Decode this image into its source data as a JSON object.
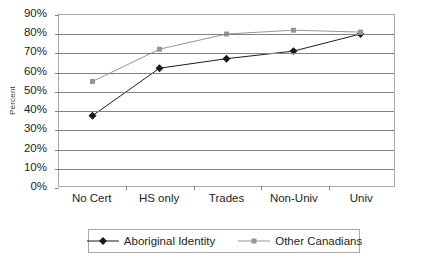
{
  "chart_data": {
    "type": "line",
    "title": "",
    "xlabel": "",
    "ylabel": "Percent",
    "categories": [
      "No Cert",
      "HS only",
      "Trades",
      "Non-Univ",
      "Univ"
    ],
    "series": [
      {
        "name": "Aboriginal Identity",
        "marker": "diamond",
        "color": "#1a1a1a",
        "values": [
          37,
          62,
          67,
          71,
          80
        ]
      },
      {
        "name": "Other Canadians",
        "marker": "square",
        "color": "#939598",
        "values": [
          55,
          72,
          80,
          82,
          81
        ]
      }
    ],
    "ylim": [
      0,
      90
    ],
    "ytick_step": 10,
    "ytick_labels": [
      "90%",
      "80%",
      "70%",
      "60%",
      "50%",
      "40%",
      "30%",
      "20%",
      "10%",
      "0%"
    ],
    "ytick_values": [
      90,
      80,
      70,
      60,
      50,
      40,
      30,
      20,
      10,
      0
    ],
    "grid": true,
    "grid_axis": "y",
    "legend_position": "bottom",
    "value_suffix": "%"
  },
  "axes": {
    "y_title": "Percent"
  },
  "legend": {
    "items": [
      {
        "label": "Aboriginal Identity"
      },
      {
        "label": "Other Canadians"
      }
    ]
  },
  "colors": {
    "series_aboriginal": "#1a1a1a",
    "series_other": "#939598",
    "gridline": "#808285",
    "frame": "#a7a9ac",
    "text": "#231f20"
  }
}
